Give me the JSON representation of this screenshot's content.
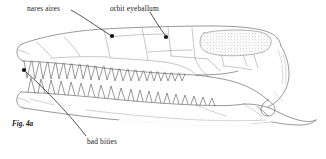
{
  "figure": {
    "domain": "scientific-illustration",
    "caption": "Fig. 4a",
    "background_color": "#ffffff",
    "ink_color": "#55555a",
    "label_color": "#1a1a1a",
    "width": 326,
    "height": 159
  },
  "labels": {
    "nares": {
      "text": "nares aires",
      "leader_dot_x": 112,
      "leader_dot_y": 36
    },
    "orbit": {
      "text": "orbit eyeballum",
      "leader_dot_x": 166,
      "leader_dot_y": 37
    },
    "bities": {
      "text": "bad bities",
      "leader_dot_x": 24,
      "leader_dot_y": 70
    }
  },
  "anatomy": {
    "upper_jaw_tooth_count": 21,
    "lower_jaw_tooth_count": 20,
    "stipple_patch": "supratemporal fenestra shading",
    "sutures_visible": true
  }
}
